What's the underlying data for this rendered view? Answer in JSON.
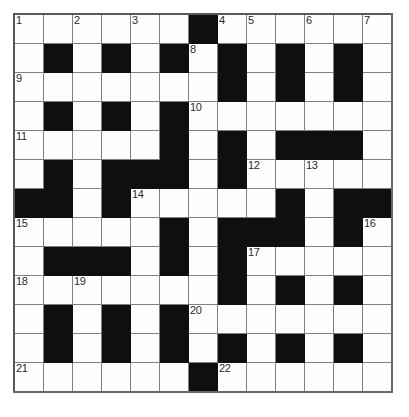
{
  "puzzle": {
    "kind": "crossword-grid",
    "title": "",
    "rows": 13,
    "columns": 13,
    "cell_size_px": 28,
    "colors": {
      "block": "#100f10",
      "open": "#fdfdfd",
      "grid_line": "#808082",
      "outer_border": "#58585a",
      "number_text": "#2a2a2c",
      "page_background": "#ffffff"
    },
    "legend": {
      "block_symbol": "#",
      "open_symbol": "."
    },
    "grid": [
      "......#......",
      ".#.#.#.#.#.#.",
      ".......#.#.#.",
      ".#.#.#.......",
      ".....#.#.###.",
      ".#.###.#.....",
      "##.#.....#.##",
      ".....#.###.#.",
      ".###.#.#.....",
      ".......#.#.#.",
      ".#.#.#.......",
      ".#.#.#.#.#.#.",
      "......#......"
    ],
    "numbers": [
      {
        "label": "1",
        "row": 0,
        "col": 0
      },
      {
        "label": "2",
        "row": 0,
        "col": 2
      },
      {
        "label": "3",
        "row": 0,
        "col": 4
      },
      {
        "label": "4",
        "row": 0,
        "col": 7
      },
      {
        "label": "5",
        "row": 0,
        "col": 8
      },
      {
        "label": "6",
        "row": 0,
        "col": 10
      },
      {
        "label": "7",
        "row": 0,
        "col": 12
      },
      {
        "label": "8",
        "row": 1,
        "col": 6
      },
      {
        "label": "9",
        "row": 2,
        "col": 0
      },
      {
        "label": "10",
        "row": 3,
        "col": 6
      },
      {
        "label": "11",
        "row": 4,
        "col": 0
      },
      {
        "label": "12",
        "row": 5,
        "col": 8
      },
      {
        "label": "13",
        "row": 5,
        "col": 10
      },
      {
        "label": "14",
        "row": 6,
        "col": 4
      },
      {
        "label": "15",
        "row": 7,
        "col": 0
      },
      {
        "label": "16",
        "row": 7,
        "col": 12
      },
      {
        "label": "17",
        "row": 8,
        "col": 8
      },
      {
        "label": "18",
        "row": 9,
        "col": 0
      },
      {
        "label": "19",
        "row": 9,
        "col": 2
      },
      {
        "label": "20",
        "row": 10,
        "col": 6
      },
      {
        "label": "21",
        "row": 12,
        "col": 0
      },
      {
        "label": "22",
        "row": 12,
        "col": 7
      }
    ],
    "entries": []
  }
}
